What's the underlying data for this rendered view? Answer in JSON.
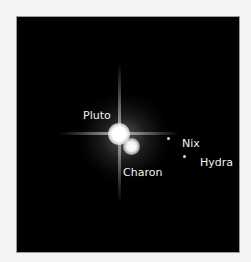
{
  "image": {
    "subject": "Pluto system",
    "background_color": "#f4f4f4",
    "panel_color": "#000000",
    "label_color": "#f2f2f2"
  },
  "labels": {
    "pluto": "Pluto",
    "charon": "Charon",
    "nix": "Nix",
    "hydra": "Hydra"
  }
}
